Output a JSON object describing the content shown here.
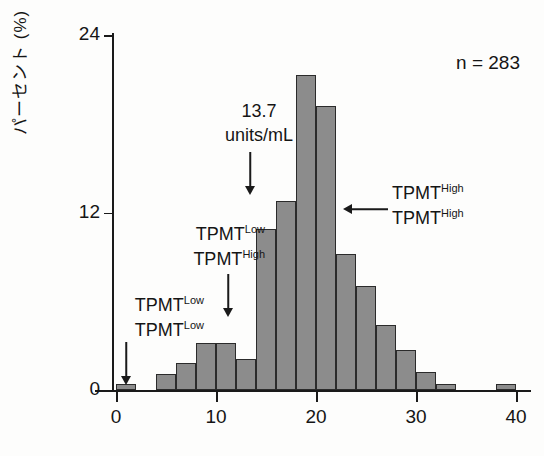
{
  "chart_data": {
    "type": "bar",
    "title": "",
    "subtitle": "",
    "xlabel": "",
    "ylabel": "パーセント (%)",
    "xlim": [
      -2,
      40
    ],
    "ylim": [
      0,
      24
    ],
    "xticks": [
      "0",
      "10",
      "20",
      "30",
      "40"
    ],
    "xtick_values": [
      0,
      10,
      20,
      30,
      40
    ],
    "yticks": [
      "0",
      "12",
      "24"
    ],
    "ytick_values": [
      0,
      12,
      24
    ],
    "grid": false,
    "legend": "none",
    "bin_width": 2,
    "bin_starts": [
      0,
      4,
      6,
      8,
      10,
      12,
      14,
      16,
      18,
      20,
      22,
      24,
      26,
      28,
      30,
      32,
      38
    ],
    "categories": [
      "0-2",
      "4-6",
      "6-8",
      "8-10",
      "10-12",
      "12-14",
      "14-16",
      "16-18",
      "18-20",
      "20-22",
      "22-24",
      "24-26",
      "26-28",
      "28-30",
      "30-32",
      "32-34",
      "38-40"
    ],
    "values": [
      0.4,
      1.1,
      1.8,
      3.2,
      3.2,
      2.1,
      10.9,
      12.8,
      21.3,
      19.2,
      9.2,
      7.0,
      4.4,
      2.7,
      1.2,
      0.4,
      0.4
    ],
    "bar_color": "#8c8c8c",
    "bar_edge_color": "#2b2b2b"
  },
  "axis": {
    "y_title": "パーセント (%)",
    "y_ticks": [
      {
        "label": "24",
        "value": 24
      },
      {
        "label": "12",
        "value": 12
      },
      {
        "label": "0",
        "value": 0
      }
    ],
    "x_ticks": [
      {
        "label": "0",
        "value": 0
      },
      {
        "label": "10",
        "value": 10
      },
      {
        "label": "20",
        "value": 20
      },
      {
        "label": "30",
        "value": 30
      },
      {
        "label": "40",
        "value": 40
      }
    ]
  },
  "annotations": {
    "sample_size": "n = 283",
    "mean_value": "13.7",
    "mean_units": "units/mL",
    "left_group": {
      "line1_base": "TPMT",
      "line1_sup": "Low",
      "line2_base": "TPMT",
      "line2_sup": "Low"
    },
    "mid_group": {
      "line1_base": "TPMT",
      "line1_sup": "Low",
      "line2_base": "TPMT",
      "line2_sup": "High"
    },
    "right_group": {
      "line1_base": "TPMT",
      "line1_sup": "High",
      "line2_base": "TPMT",
      "line2_sup": "High"
    }
  },
  "colors": {
    "bar_fill": "#8c8c8c",
    "bar_stroke": "#2b2b2b",
    "axis": "#1a1a1a",
    "text": "#151515",
    "background": "#fdfdfc"
  }
}
